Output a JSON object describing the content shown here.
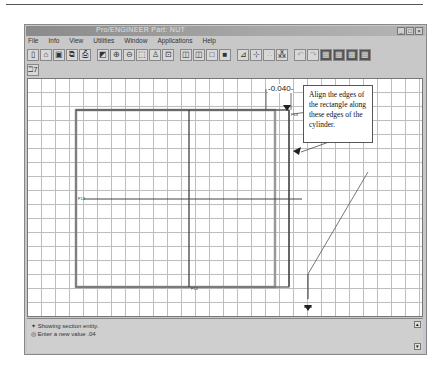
{
  "window": {
    "title": "Pro/ENGINEER Part: NUT",
    "controls": [
      "_",
      "□",
      "×"
    ]
  },
  "menubar": {
    "items": [
      "File",
      "Info",
      "View",
      "Utilities",
      "Window",
      "Applications",
      "Help"
    ]
  },
  "toolbar": {
    "buttons": [
      {
        "name": "new",
        "glyph": "▯"
      },
      {
        "name": "open",
        "glyph": "⌂"
      },
      {
        "name": "save",
        "glyph": "▣"
      },
      {
        "name": "save-copy",
        "glyph": "⧉"
      },
      {
        "name": "print",
        "glyph": "⎙"
      },
      {
        "name": "repaint",
        "glyph": "◩"
      },
      {
        "name": "zoom-in",
        "glyph": "⊕"
      },
      {
        "name": "zoom-out",
        "glyph": "⊖"
      },
      {
        "name": "refit",
        "glyph": "⬚"
      },
      {
        "name": "orient",
        "glyph": "♙"
      },
      {
        "name": "saved-views",
        "glyph": "⊡"
      },
      {
        "name": "wireframe",
        "glyph": "◫"
      },
      {
        "name": "hidden-line",
        "glyph": "◫"
      },
      {
        "name": "no-hidden",
        "glyph": "□"
      },
      {
        "name": "shading",
        "glyph": "■"
      },
      {
        "name": "datum-planes",
        "glyph": "⊿"
      },
      {
        "name": "datum-axes",
        "glyph": "⊹"
      },
      {
        "name": "points",
        "glyph": "∴"
      },
      {
        "name": "coord-sys",
        "glyph": "⁂"
      },
      {
        "name": "undo",
        "glyph": "↶"
      },
      {
        "name": "redo",
        "glyph": "↷"
      },
      {
        "name": "model-tree",
        "glyph": "▦"
      },
      {
        "name": "layers",
        "glyph": "▦"
      },
      {
        "name": "grid",
        "glyph": "▦"
      },
      {
        "name": "settings",
        "glyph": "▦"
      }
    ],
    "help_button": "ℶ7"
  },
  "sketch": {
    "dimension_label": "-0.040-",
    "callout_text": "Align the edges of the rectangle along these edges of the cylinder.",
    "entity_tags": [
      "F14",
      "F14",
      "F14",
      "F14"
    ]
  },
  "messages": [
    "Showing section entity.",
    "Enter a new value .04"
  ]
}
